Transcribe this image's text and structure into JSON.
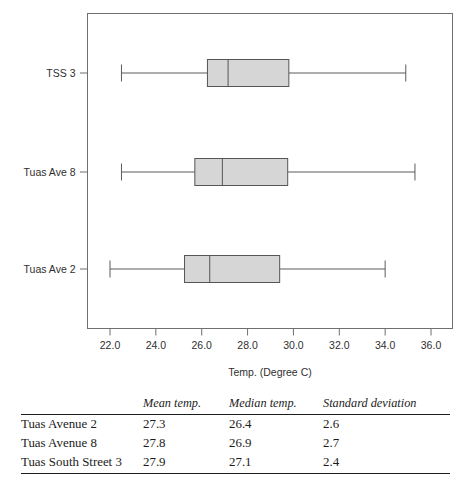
{
  "chart_data": {
    "type": "box",
    "title": "",
    "xlabel": "Temp. (Degree C)",
    "ylabel": "",
    "orientation": "horizontal",
    "xlim": [
      21.0,
      36.8
    ],
    "xticks": [
      22.0,
      24.0,
      26.0,
      28.0,
      30.0,
      32.0,
      34.0,
      36.0
    ],
    "xticklabels": [
      "22.0",
      "24.0",
      "26.0",
      "28.0",
      "30.0",
      "32.0",
      "34.0",
      "36.0"
    ],
    "categories": [
      "TSS 3",
      "Tuas Ave 8",
      "Tuas Ave 2"
    ],
    "grid": false,
    "legend": false,
    "box_fill": "#d6d6d6",
    "box_stroke": "#555555",
    "boxes": [
      {
        "category": "TSS 3",
        "whisker_low": 22.5,
        "q1": 26.25,
        "median": 27.15,
        "q3": 29.8,
        "whisker_high": 34.9
      },
      {
        "category": "Tuas Ave 8",
        "whisker_low": 22.5,
        "q1": 25.7,
        "median": 26.9,
        "q3": 29.75,
        "whisker_high": 35.3
      },
      {
        "category": "Tuas Ave 2",
        "whisker_low": 22.0,
        "q1": 25.25,
        "median": 26.35,
        "q3": 29.4,
        "whisker_high": 34.0
      }
    ]
  },
  "table": {
    "columns": [
      "",
      "Mean temp.",
      "Median temp.",
      "Standard deviation"
    ],
    "rows": [
      {
        "site": "Tuas Avenue 2",
        "mean": "27.3",
        "median": "26.4",
        "sd": "2.6"
      },
      {
        "site": "Tuas Avenue 8",
        "mean": "27.8",
        "median": "26.9",
        "sd": "2.7"
      },
      {
        "site": "Tuas South Street 3",
        "mean": "27.9",
        "median": "27.1",
        "sd": "2.4"
      }
    ]
  }
}
